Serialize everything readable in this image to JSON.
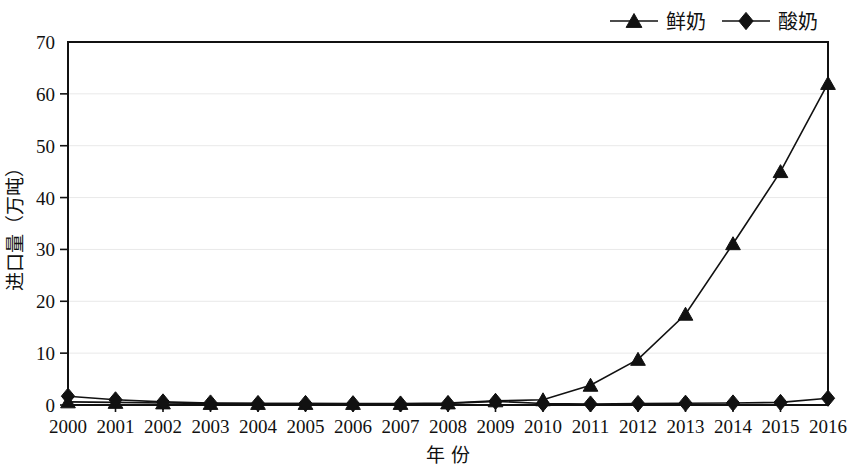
{
  "chart_data": {
    "type": "line",
    "title": "",
    "xlabel": "年 份",
    "ylabel": "进口量（万吨）",
    "xlim": [
      2000,
      2016
    ],
    "ylim": [
      0,
      70
    ],
    "yticks": [
      0,
      10,
      20,
      30,
      40,
      50,
      60,
      70
    ],
    "grid": true,
    "legend_position": "top-right",
    "categories": [
      "2000",
      "2001",
      "2002",
      "2003",
      "2004",
      "2005",
      "2006",
      "2007",
      "2008",
      "2009",
      "2010",
      "2011",
      "2012",
      "2013",
      "2014",
      "2015",
      "2016"
    ],
    "series": [
      {
        "name": "鲜奶",
        "marker": "triangle",
        "color": "#111111",
        "values": [
          0.6,
          0.5,
          0.4,
          0.3,
          0.3,
          0.3,
          0.3,
          0.3,
          0.4,
          0.8,
          1.0,
          3.8,
          8.8,
          17.5,
          31.1,
          45.0,
          62.0
        ]
      },
      {
        "name": "酸奶",
        "marker": "diamond",
        "color": "#111111",
        "values": [
          1.7,
          1.0,
          0.6,
          0.4,
          0.3,
          0.3,
          0.25,
          0.2,
          0.3,
          0.7,
          0.3,
          0.2,
          0.3,
          0.35,
          0.4,
          0.5,
          1.3
        ]
      }
    ]
  },
  "legend": {
    "items": [
      {
        "label": "鲜奶",
        "marker": "triangle"
      },
      {
        "label": "酸奶",
        "marker": "diamond"
      }
    ]
  },
  "axes": {
    "y_title": "进口量（万吨）",
    "x_title": "年 份",
    "y_tick_labels": [
      "0",
      "10",
      "20",
      "30",
      "40",
      "50",
      "60",
      "70"
    ],
    "x_tick_labels": [
      "2000",
      "2001",
      "2002",
      "2003",
      "2004",
      "2005",
      "2006",
      "2007",
      "2008",
      "2009",
      "2010",
      "2011",
      "2012",
      "2013",
      "2014",
      "2015",
      "2016"
    ]
  }
}
